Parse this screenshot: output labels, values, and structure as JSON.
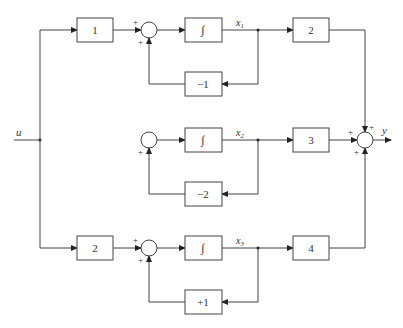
{
  "diagram": {
    "type": "block-diagram",
    "input_label": "u",
    "output_label": "y",
    "rows": [
      {
        "gain_in": "1",
        "integrator": "∫",
        "state": "x",
        "state_sub": "1",
        "gain_out": "2",
        "feedback": "−1",
        "summer_signs": [
          "+",
          "+"
        ]
      },
      {
        "gain_in": null,
        "integrator": "∫",
        "state": "x",
        "state_sub": "2",
        "gain_out": "3",
        "feedback": "−2",
        "summer_signs": [
          "+"
        ]
      },
      {
        "gain_in": "2",
        "integrator": "∫",
        "state": "x",
        "state_sub": "3",
        "gain_out": "4",
        "feedback": "+1",
        "summer_signs": [
          "+",
          "+"
        ]
      }
    ],
    "output_summer_signs": [
      "+",
      "+",
      "+"
    ]
  }
}
